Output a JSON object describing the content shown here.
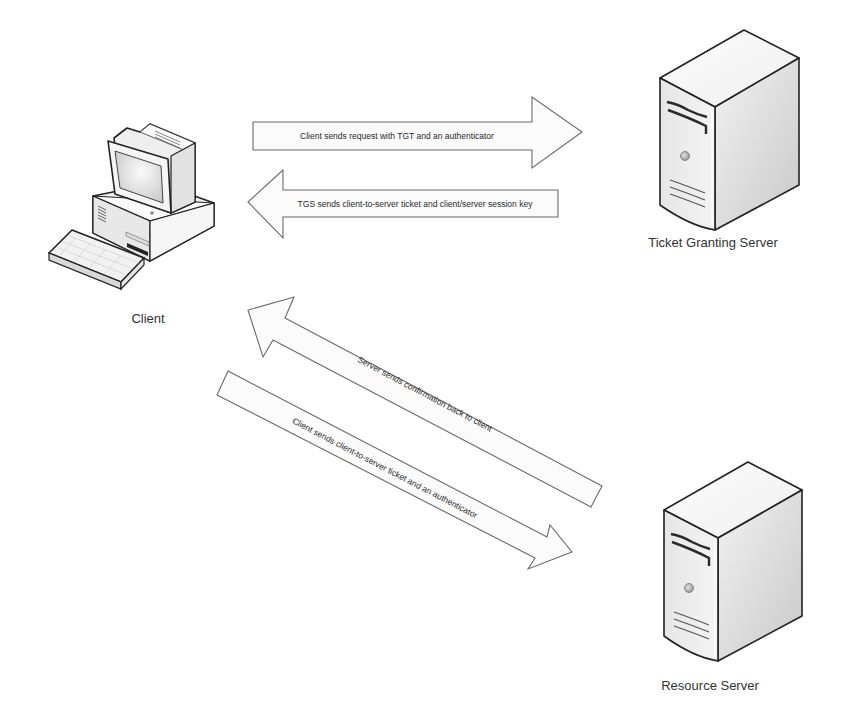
{
  "diagram": {
    "nodes": {
      "client": {
        "label": "Client",
        "icon": "desktop-computer-icon"
      },
      "tgs": {
        "label": "Ticket Granting Server",
        "icon": "tower-server-icon"
      },
      "resource": {
        "label": "Resource Server",
        "icon": "tower-server-icon"
      }
    },
    "arrows": [
      {
        "from": "Client",
        "to": "Ticket Granting Server",
        "label": "Client sends request with TGT and an authenticator"
      },
      {
        "from": "Ticket Granting Server",
        "to": "Client",
        "label": "TGS sends client-to-server ticket and client/server session key"
      },
      {
        "from": "Resource Server",
        "to": "Client",
        "label": "Server sends confirmation back to client"
      },
      {
        "from": "Client",
        "to": "Resource Server",
        "label": "Client sends client-to-server ticket and an authenticator"
      }
    ],
    "colors": {
      "background": "#ffffff",
      "arrow_fill": "#fbfbfb",
      "arrow_stroke": "#6a6a6a",
      "text": "#333333"
    }
  }
}
